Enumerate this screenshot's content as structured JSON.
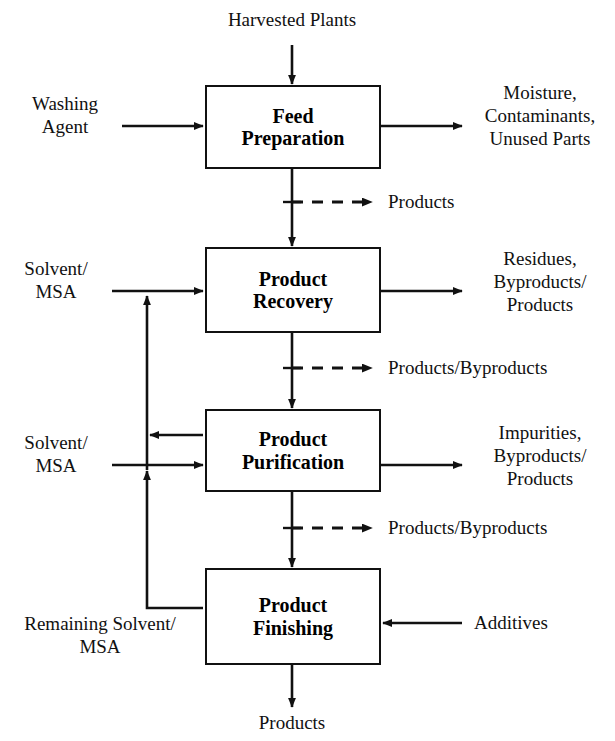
{
  "diagram": {
    "type": "process-flow-diagram",
    "background_color": "#ffffff",
    "line_color": "#111111",
    "text_color": "#111111"
  },
  "units": [
    {
      "id": "feed-preparation",
      "label": "Feed\nPreparation"
    },
    {
      "id": "product-recovery",
      "label": "Product\nRecovery"
    },
    {
      "id": "product-purification",
      "label": "Product\nPurification"
    },
    {
      "id": "product-finishing",
      "label": "Product\nFinishing"
    }
  ],
  "streams": {
    "harvested_plants": "Harvested Plants",
    "washing_agent": "Washing\nAgent",
    "moisture_contaminants": "Moisture,\nContaminants,\nUnused Parts",
    "products_1": "Products",
    "solvent_msa_recovery": "Solvent/\nMSA",
    "residues_byproducts": "Residues,\nByproducts/\nProducts",
    "products_byproducts_1": "Products/Byproducts",
    "solvent_msa_purification": "Solvent/\nMSA",
    "impurities_byproducts": "Impurities,\nByproducts/\nProducts",
    "products_byproducts_2": "Products/Byproducts",
    "remaining_solvent_msa": "Remaining Solvent/\nMSA",
    "additives": "Additives",
    "products_final": "Products"
  }
}
